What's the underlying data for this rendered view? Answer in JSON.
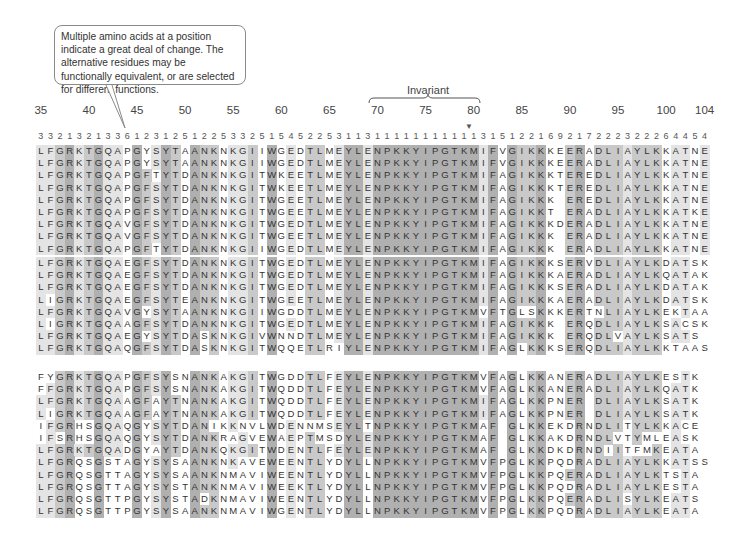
{
  "callout": {
    "text": "Multiple amino acids at a position indicate a great deal of change. The alternative residues may be functionally equivalent, or are selected for different functions."
  },
  "invariant_label": "Invariant",
  "position_labels": [
    "35",
    "40",
    "45",
    "50",
    "55",
    "60",
    "65",
    "70",
    "75",
    "80",
    "85",
    "90",
    "95",
    "100",
    "104"
  ],
  "position_label_indices": [
    0,
    5,
    10,
    15,
    20,
    25,
    30,
    35,
    40,
    45,
    50,
    55,
    60,
    65,
    69
  ],
  "start_position": 35,
  "end_position": 104,
  "invariant_range": [
    70,
    80
  ],
  "marker_position": 80,
  "variability_counts": [
    "3",
    "3",
    "2",
    "1",
    "3",
    "2",
    "1",
    "3",
    "3",
    "6",
    "1",
    "2",
    "3",
    "1",
    "2",
    "5",
    "1",
    "2",
    "2",
    "5",
    "3",
    "3",
    "2",
    "5",
    "1",
    "5",
    "4",
    "5",
    "2",
    "2",
    "5",
    "3",
    "1",
    "1",
    "3",
    "1",
    "1",
    "1",
    "1",
    "1",
    "1",
    "1",
    "1",
    "1",
    "1",
    "1",
    "3",
    "1",
    "5",
    "1",
    "2",
    "2",
    "1",
    "6",
    "9",
    "2",
    "1",
    "7",
    "2",
    "2",
    "2",
    "3",
    "2",
    "2",
    "2",
    "6",
    "4",
    "4",
    "5",
    "4"
  ],
  "blocks": [
    [
      "LFGRKTGQAPGYSYTAANKNKGIIWGEDTLMEYLENPKKYIPGTKMIFVGIKKKEERADLIAYLKKATNE",
      "LFGRKTGQAPGYSYTAANKNKGIIWGEDTLMEYLENPKKYIPGTKMIFVGIKKKEERADLIAYLKKATNE",
      "LFGRKTGQAPGFTYTDANKNKGITWKEETLMEYLENPKKYIPGTKMIFAGIKKKTEREDLIAYLKKATNE",
      "LFGRKTGQAPGFSYTDANKNKGITWKEETLMEYLENPKKYIPGTKMIFAGIKKKTEREDLIAYLKKATNE",
      "LFGRKTGQAPGFSYTDANKNKGITWGEETLMEYLENPKKYIPGTKMIFAGIKKK EREDLIAYLKKATNE",
      "LFGRKTGQAPGFSYTDANKNKGITWGEETLMEYLENPKKYIPGTKMIFAGIKKT ERADLIAYLKKATKE",
      "LFGRKTGQAVGFSYTDANKNKGITWGEDTLMEYLENPKKYIPGTKMIFAGIKKKDERADLIAYLKKATNE",
      "LFGRKTGQAVGFSYTDANKNKGITWGEETLMEYLENPKKYIPGTKMIFAGIKKK ERADLIAYLKKATNE",
      "LFGRKTGQAPGFTYTDANKNKGIIWGEDTLMEYLENPKKYIPGTKMIFAGIKKK ERADLIAYLKKATNE"
    ],
    [
      "LFGRKTGQAEGFSYTDANKNKGITWGEDTLMEYLENPKKYIPGTKMIFAGIKKKSERVDLIAYLKDATSK",
      "LFGRKTGQAEGFSYTDANKNKGITWGEDTLMEYLENPKKYIPGTKMIFAGIKKKAERADLIAYLKQATAK",
      "LFGRKTGQAEGFSYTDANKNKGITWGEDTLMEYLENPKKYIPGTKMIFAGIKKKSERADLIAYLKDATAK",
      "LIGRKTGQAEGFSYTEANKNKGITWGEETLMEYLENPKKYIPGTKMIFAGIKKKAERADLIAYLKDATSK",
      "LFGRKTGQAVGYSYTAANKNKGIIWGDDTLMEYLENPKKYIPGTKMVFTGLSKKKERTNLIAYLKEKTAA",
      "LIGRKTGQAAGFSYTDANKNKGITWGEDTLMEYLENPKKYIPGTKMIFAGIKKK ERQDLIAYLKSACSK",
      "LFGRKTGQAEGYSYTDASKNKGIVWNNDTLMEYLENPKKYIPGTKMIFAGIKKK ERQDLVAYLKSATS ",
      "LFGRKTGQAQGFSYTDASKNKGITWQQETLRIYLENPKKYIPGTKMIFAGLKKKSERQDLIAYLKKTAAS"
    ],
    [
      "FYGRKTGQAPGFSYSNANKAKGITWGDDTLFEYLENPKKYIPGTKMVFAGLKKANERADLIAYLKESTK",
      "FFGRKTGQAPGFSYSNANKAKGITWQDDTLFEYLENPKKYIPGTKMVFAGLKKANERADLIAYLKQATK",
      "LFGRKTGQAAGFAYTNANKAKGITWQDDTLFEYLENPKKYIPGTKMIFAGLKKPNER DLIAYLKSATK",
      "LIGRKTGQAAGFAYTNANKAKGITWQDDTLFEYLENPKKYIPGTKMIFAGLKKPNER DLIAYLKSATK",
      "IFGRHSGQAQGYSYTDANIKKNVLWDENNMSEYLTNPKKYIPGTKMAF GLKKEKDRNDLITYLKKACE",
      "IFSRHSGQAQGYSYTDANKRAGVEWAEPTMSDYLENPKKYIPGTKMAF GLKKAKDRNDLVTYMLEASK",
      "LFGRKTGQADGYAYTDANKQKGITWDENTLFEYLENPKKYIPGTKMAF GLKKDKDRNDIITFMKEATA",
      "LFGRQSGSTAGYSYSAANKNKAVEWEENTLYDYLLNPKKYIPGTKMVFPGLKKPQDRADLIAYLKKATSS",
      "LFGRQSGTTAGYSYSAANKNMAVIWEENTLYDYLLNPKKYIPGTKMVFPGLKKPQERADLIAYLKTSTA",
      "LFGRQSGTTAGYSYSTANKNMAVIWEEKTLYDYLLNPKKYIPGTKMVFPGLKKPQDRADLIAYLKESTA",
      "LFGRQSGTTPGYSYSTADKNMAVIWEENTLYDYLLNPKKYIPGTKMVFPGLKKPQERADLISYLKEATS",
      "LFGRQSGTTPGYSYSAANKNMAVIWGENTLYDYLLNPKKYIPGTKMVFPGLKKPQDRADLIAYLKEATA"
    ]
  ],
  "colors": {
    "shade_light": "#e4e4e4",
    "shade_mid": "#c9c9c9",
    "shade_dark": "#b0b0b0",
    "text": "#333333"
  }
}
